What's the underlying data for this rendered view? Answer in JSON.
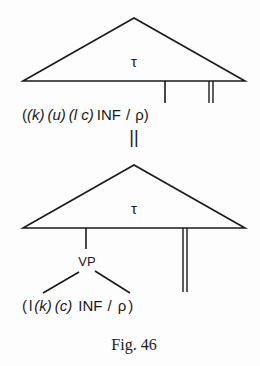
{
  "figure": {
    "caption": "Fig. 46",
    "equivalence_symbol": "||",
    "top_tree": {
      "node_label": "τ",
      "terminal_string": {
        "open": "(",
        "k": "(k)",
        "u": "(u)",
        "lc": "(l c)",
        "inf": "INF",
        "slash": "/",
        "rho": "ρ",
        "close": ")"
      },
      "lines": [
        "single line to INF",
        "double line to ρ"
      ]
    },
    "bottom_tree": {
      "node_label": "τ",
      "vp_label": "VP",
      "terminal_string": {
        "open": "(",
        "l": "l",
        "k": "(k)",
        "c": "(c)",
        "inf": "INF",
        "slash": "/",
        "rho": "ρ",
        "close": ")"
      },
      "lines": [
        "single line to VP",
        "VP branches to l and INF",
        "double line to ρ"
      ]
    }
  }
}
